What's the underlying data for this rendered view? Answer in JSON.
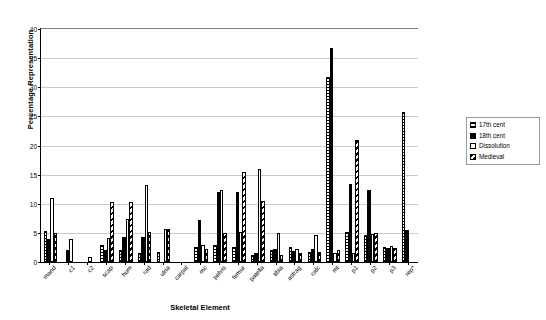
{
  "chart_data": {
    "type": "bar",
    "title": "",
    "xlabel": "Skeletal Element",
    "ylabel": "Percentage Representation",
    "ylim": [
      0,
      40
    ],
    "ytick_values": [
      0,
      5,
      10,
      15,
      20,
      25,
      30,
      35,
      40
    ],
    "ytick_labels": [
      "0",
      "5",
      "10",
      "15",
      "20",
      "25",
      "30",
      "35",
      "40"
    ],
    "grid": true,
    "legend_position": "right",
    "categories": [
      "mand",
      "c1",
      "c2",
      "scap",
      "hum",
      "rad",
      "ulna",
      "carpal",
      "mc",
      "pelvis",
      "femur",
      "patella",
      "tibia",
      "astrag",
      "calc",
      "mt",
      "p1",
      "p2",
      "p3",
      "rep*"
    ],
    "series": [
      {
        "name": "17th cent",
        "pattern": "horizontal-hatch",
        "values": [
          5.3,
          0,
          0,
          3.0,
          2.0,
          1.5,
          1.8,
          0,
          2.6,
          3.0,
          2.6,
          1.2,
          2.0,
          2.5,
          1.8,
          31.8,
          5.2,
          4.6,
          2.5,
          25.7
        ]
      },
      {
        "name": "18th cent",
        "pattern": "solid-black",
        "values": [
          4.0,
          2.0,
          0,
          2.1,
          4.3,
          4.3,
          0,
          0,
          7.2,
          12.0,
          12.0,
          1.5,
          2.2,
          1.9,
          2.2,
          36.7,
          13.4,
          12.3,
          2.4,
          5.5
        ]
      },
      {
        "name": "Dissolution",
        "pattern": "white",
        "values": [
          11.0,
          4.0,
          0.8,
          4.1,
          7.3,
          13.3,
          5.6,
          0,
          3.0,
          12.3,
          5.2,
          16.0,
          5.0,
          2.2,
          4.7,
          1.6,
          1.6,
          4.8,
          2.8,
          0
        ]
      },
      {
        "name": "Medieval",
        "pattern": "diagonal-hatch",
        "values": [
          5.0,
          0,
          0,
          10.3,
          10.3,
          5.2,
          5.6,
          0,
          2.3,
          4.9,
          15.4,
          10.4,
          1.2,
          1.5,
          1.8,
          2.1,
          20.9,
          5.0,
          2.4,
          0
        ]
      }
    ]
  },
  "legend": {
    "items": [
      {
        "label": "17th cent"
      },
      {
        "label": "18th cent"
      },
      {
        "label": "Dissolution"
      },
      {
        "label": "Medieval"
      }
    ]
  }
}
